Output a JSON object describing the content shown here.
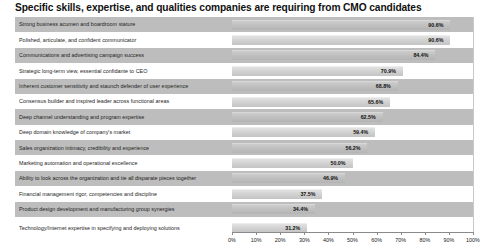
{
  "chart_data": {
    "type": "bar",
    "orientation": "horizontal",
    "title": "Specific skills, expertise, and qualities companies are requiring from CMO candidates",
    "xlabel": "",
    "ylabel": "",
    "xlim": [
      0,
      100
    ],
    "grid": true,
    "legend": false,
    "value_suffix": "%",
    "tick_labels": [
      "0%",
      "10%",
      "20%",
      "30%",
      "40%",
      "50%",
      "60%",
      "70%",
      "80%",
      "90%",
      "100%"
    ],
    "tick_values": [
      0,
      10,
      20,
      30,
      40,
      50,
      60,
      70,
      80,
      90,
      100
    ],
    "categories": [
      "Strong business acumen and boardroom stature",
      "Polished, articulate, and confident communicator",
      "Communications and advertising campaign success",
      "Strategic long-term view, essential confidante to CEO",
      "Inherent customer sensitivity and staunch defender of user experience",
      "Consensus builder and inspired leader across functional areas",
      "Deep channel understanding and program expertise",
      "Deep domain knowledge of company's market",
      "Sales organization intimacy, credibility and experience",
      "Marketing automation and operational excellence",
      "Ability to look across the organization and tie all disparate pieces together",
      "Financial management rigor, competencies and discipline",
      "Product design development and manufacturing group synergies",
      "Technology/Internet expertise in specifying and deploying solutions"
    ],
    "values": [
      90.6,
      90.6,
      84.4,
      70.9,
      68.8,
      65.6,
      62.5,
      59.4,
      56.2,
      50.0,
      46.9,
      37.5,
      34.4,
      31.2
    ],
    "value_labels": [
      "90.6%",
      "90.6%",
      "84.4%",
      "70.9%",
      "68.8%",
      "65.6%",
      "62.5%",
      "59.4%",
      "56.2%",
      "50.0%",
      "46.9%",
      "37.5%",
      "34.4%",
      "31.2%"
    ],
    "colors": {
      "bar_light": "#d2d2d2",
      "bar_on_band": "#c0c0c0",
      "row_band": "#bdbdbd",
      "row_plain": "#ffffff",
      "gridline": "#c9c9c9",
      "axis": "#8a8a8a",
      "text": "#1a1a1a"
    }
  }
}
